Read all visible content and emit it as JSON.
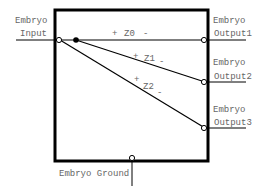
{
  "diagram": {
    "input": {
      "line1": "Embryo",
      "line2": "Input"
    },
    "outputs": [
      {
        "line1": "Embryo",
        "line2": "Output1"
      },
      {
        "line1": "Embryo",
        "line2": "Output2"
      },
      {
        "line1": "Embryo",
        "line2": "Output3"
      }
    ],
    "ground": "Embryo Ground",
    "impedances": [
      {
        "plus": "+",
        "name": "Z0",
        "minus": "-"
      },
      {
        "plus": "+",
        "name": "Z1",
        "minus": "-"
      },
      {
        "plus": "+",
        "name": "Z2",
        "minus": "-"
      }
    ]
  }
}
